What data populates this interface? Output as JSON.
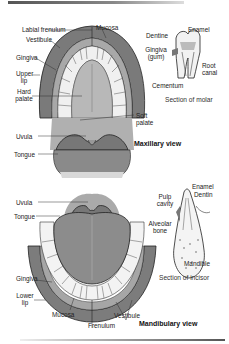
{
  "maxillary": {
    "title": "Maxillary view",
    "labels": {
      "labial_frenulum": "Labial frenulum",
      "mucosa": "Mucosa",
      "vestibule": "Vestibule",
      "gingiva": "Gingiva",
      "upper_lip_1": "Upper",
      "upper_lip_2": "lip",
      "hard_palate_1": "Hard",
      "hard_palate_2": "palate",
      "soft_palate_1": "Soft",
      "soft_palate_2": "palate",
      "uvula": "Uvula",
      "tongue": "Tongue"
    }
  },
  "molar": {
    "caption": "Section of molar",
    "labels": {
      "enamel": "Enamel",
      "dentine": "Dentine",
      "gingiva_1": "Gingiva",
      "gingiva_2": "(gum)",
      "root_canal_1": "Root",
      "root_canal_2": "canal",
      "cementum": "Cementum"
    }
  },
  "mandibular": {
    "title": "Mandibulary view",
    "labels": {
      "uvula": "Uvula",
      "tongue": "Tongue",
      "gingiva": "Gingiva",
      "lower_lip_1": "Lower",
      "lower_lip_2": "lip",
      "mucosa": "Mucosa",
      "frenulum": "Frenulum",
      "vestibule": "Vestibule"
    }
  },
  "incisor": {
    "caption": "Section of incisor",
    "labels": {
      "enamel": "Enamel",
      "dentin": "Dentin",
      "pulp_cavity_1": "Pulp",
      "pulp_cavity_2": "cavity",
      "alveolar_bone_1": "Alveolar",
      "alveolar_bone_2": "bone",
      "mandible": "Mandible"
    }
  },
  "colors": {
    "lip": "#7a7a7a",
    "mucosa": "#9a9a9a",
    "tongue": "#8c8c8c",
    "palate": "#b5b5b5",
    "tooth": "#f4f4f4",
    "outline": "#222222"
  }
}
